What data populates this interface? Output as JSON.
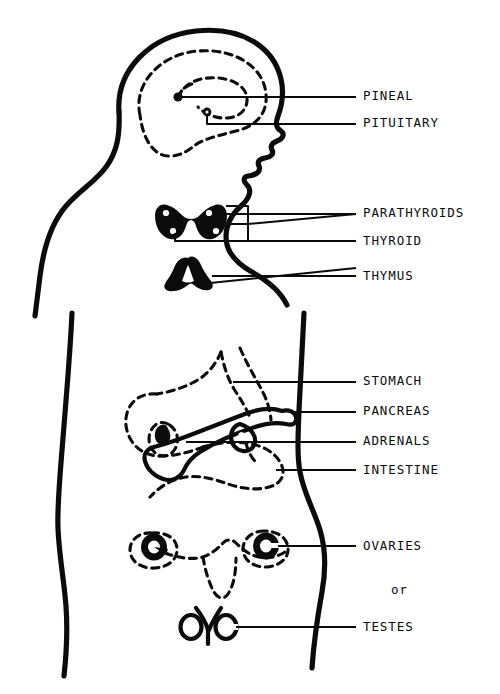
{
  "diagram": {
    "ink_color": "#0b0b0b",
    "background_color": "#ffffff",
    "conjunction_label": "or",
    "labels": [
      {
        "id": "pineal",
        "text": "PINEAL"
      },
      {
        "id": "pituitary",
        "text": "PITUITARY"
      },
      {
        "id": "parathyroids",
        "text": "PARATHYROIDS"
      },
      {
        "id": "thyroid",
        "text": "THYROID"
      },
      {
        "id": "thymus",
        "text": "THYMUS"
      },
      {
        "id": "stomach",
        "text": "STOMACH"
      },
      {
        "id": "pancreas",
        "text": "PANCREAS"
      },
      {
        "id": "adrenals",
        "text": "ADRENALS"
      },
      {
        "id": "intestine",
        "text": "INTESTINE"
      },
      {
        "id": "ovaries",
        "text": "OVARIES"
      },
      {
        "id": "testes",
        "text": "TESTES"
      }
    ]
  }
}
